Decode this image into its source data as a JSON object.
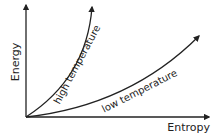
{
  "diagram": {
    "y_axis_label": "Energy",
    "x_axis_label": "Entropy",
    "curves": [
      {
        "name": "high-temperature-curve",
        "label": "high temperature"
      },
      {
        "name": "low-temperature-curve",
        "label": "low temperature"
      }
    ],
    "colors": {
      "stroke": "#222222",
      "background": "#ffffff"
    }
  }
}
